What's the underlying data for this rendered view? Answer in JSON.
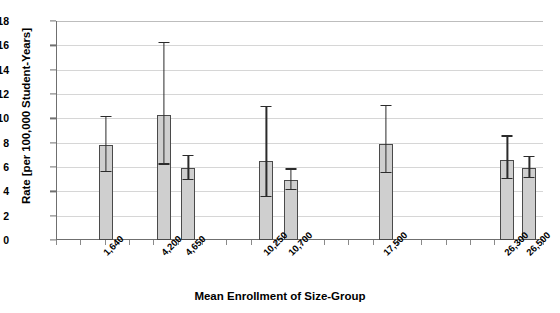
{
  "chart_data": {
    "type": "bar",
    "title": "",
    "xlabel": "Mean Enrollment of Size-Group",
    "ylabel": "Rate [per 100,000 Student-Years]",
    "categories": [
      "1,640",
      "4,200",
      "4,650",
      "10,250",
      "10,700",
      "17,500",
      "26,300",
      "26,500"
    ],
    "values": [
      7.8,
      10.3,
      5.9,
      6.5,
      4.9,
      7.9,
      6.6,
      5.9
    ],
    "error_high": [
      10.2,
      16.3,
      7.0,
      11.0,
      5.9,
      11.1,
      8.6,
      6.9
    ],
    "error_low": [
      5.6,
      6.2,
      4.9,
      3.5,
      4.1,
      5.5,
      5.0,
      5.1
    ],
    "ylim": [
      0,
      18
    ],
    "yticks": [
      0,
      2,
      4,
      6,
      8,
      10,
      12,
      14,
      16,
      18
    ],
    "ytick_labels": [
      "0",
      "2",
      "4",
      "6",
      "8",
      "10",
      "12",
      "14",
      "16",
      "18"
    ],
    "grid": true,
    "legend": "none",
    "bar_color": "#cfcfcf",
    "bar_border_color": "#4a4a4a",
    "error_color": "#2b2b2b",
    "grid_color": "#d6d6d6",
    "axis_color": "#6f6f6f",
    "slot_positions": [
      1.5,
      3.9,
      4.9,
      8.1,
      9.1,
      13.0,
      18.0,
      18.9
    ],
    "x_slot_count": 20
  }
}
